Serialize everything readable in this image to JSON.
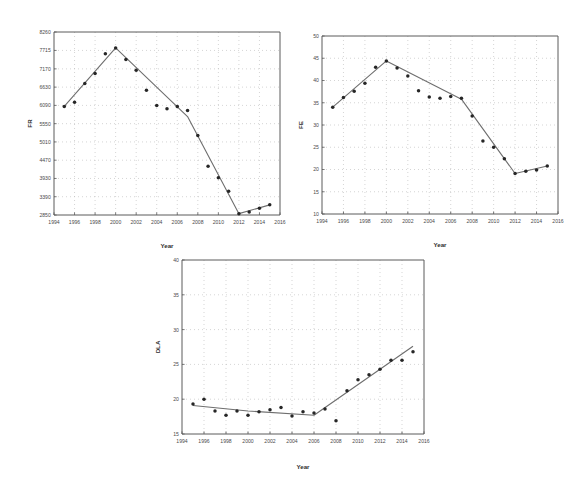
{
  "page": {
    "background": "#ffffff",
    "point_color": "#262626",
    "line_color": "#6e6e6e",
    "grid_color": "#b9b9b9",
    "axis_color": "#5a5a5a"
  },
  "chart_data": [
    {
      "id": "chart-1",
      "type": "scatter",
      "title": "",
      "xlabel": "Year",
      "ylabel": "FR",
      "xlim": [
        1994,
        2016
      ],
      "ylim": [
        2850,
        8260
      ],
      "xticks": [
        1994,
        1996,
        1998,
        2000,
        2002,
        2004,
        2006,
        2008,
        2010,
        2012,
        2014,
        2016
      ],
      "yticks": [
        2850,
        3390,
        3930,
        4470,
        5010,
        5550,
        6090,
        6630,
        7170,
        7715,
        8260
      ],
      "grid": true,
      "legend": "none",
      "x": [
        1995,
        1996,
        1997,
        1998,
        1999,
        2000,
        2001,
        2002,
        2003,
        2004,
        2005,
        2006,
        2007,
        2008,
        2009,
        2010,
        2011,
        2012,
        2013,
        2014,
        2015
      ],
      "values": [
        6060,
        6180,
        6740,
        7030,
        7620,
        7790,
        7450,
        7130,
        6540,
        6090,
        5990,
        6060,
        5940,
        5200,
        4290,
        3950,
        3550,
        2890,
        2940,
        3050,
        3150
      ],
      "series": [
        {
          "name": "FR observations",
          "values": [
            6060,
            6180,
            6740,
            7030,
            7620,
            7790,
            7450,
            7130,
            6540,
            6090,
            5990,
            6060,
            5940,
            5200,
            4290,
            3950,
            3550,
            2890,
            2940,
            3050,
            3150
          ]
        },
        {
          "name": "fitted trend",
          "x": [
            1995,
            2000,
            2007,
            2012,
            2015
          ],
          "values": [
            6060,
            7790,
            5760,
            2890,
            3150
          ]
        }
      ]
    },
    {
      "id": "chart-2",
      "type": "scatter",
      "title": "",
      "xlabel": "Year",
      "ylabel": "FE",
      "xlim": [
        1994,
        2016
      ],
      "ylim": [
        10,
        50
      ],
      "xticks": [
        1994,
        1996,
        1998,
        2000,
        2002,
        2004,
        2006,
        2008,
        2010,
        2012,
        2014,
        2016
      ],
      "yticks": [
        10,
        15,
        20,
        25,
        30,
        35,
        40,
        45,
        50
      ],
      "grid": true,
      "legend": "none",
      "x": [
        1995,
        1996,
        1997,
        1998,
        1999,
        2000,
        2001,
        2002,
        2003,
        2004,
        2005,
        2006,
        2007,
        2008,
        2009,
        2010,
        2011,
        2012,
        2013,
        2014,
        2015
      ],
      "values": [
        34.0,
        36.2,
        37.6,
        39.4,
        43.0,
        44.4,
        42.8,
        41.0,
        37.7,
        36.3,
        36.0,
        36.4,
        36.0,
        32.0,
        26.4,
        25.0,
        22.4,
        19.1,
        19.6,
        19.9,
        20.8
      ],
      "series": [
        {
          "name": "FE observations",
          "values": [
            34.0,
            36.2,
            37.6,
            39.4,
            43.0,
            44.4,
            42.8,
            41.0,
            37.7,
            36.3,
            36.0,
            36.4,
            36.0,
            32.0,
            26.4,
            25.0,
            22.4,
            19.1,
            19.6,
            19.9,
            20.8
          ]
        },
        {
          "name": "fitted trend",
          "x": [
            1995,
            2000,
            2007,
            2012,
            2015
          ],
          "values": [
            34.0,
            44.4,
            35.8,
            19.1,
            20.8
          ]
        }
      ]
    },
    {
      "id": "chart-3",
      "type": "scatter",
      "title": "",
      "xlabel": "Year",
      "ylabel": "DLA",
      "xlim": [
        1994,
        2016
      ],
      "ylim": [
        15,
        40
      ],
      "xticks": [
        1994,
        1996,
        1998,
        2000,
        2002,
        2004,
        2006,
        2008,
        2010,
        2012,
        2014,
        2016
      ],
      "yticks": [
        15,
        20,
        25,
        30,
        35,
        40
      ],
      "grid": true,
      "legend": "none",
      "x": [
        1995,
        1996,
        1997,
        1998,
        1999,
        2000,
        2001,
        2002,
        2003,
        2004,
        2005,
        2006,
        2007,
        2008,
        2009,
        2010,
        2011,
        2012,
        2013,
        2014,
        2015
      ],
      "values": [
        19.3,
        20.0,
        18.3,
        17.7,
        18.3,
        17.7,
        18.2,
        18.5,
        18.8,
        17.6,
        18.2,
        18.0,
        18.6,
        16.9,
        21.2,
        22.8,
        23.5,
        24.3,
        25.6,
        25.6,
        26.8
      ],
      "series": [
        {
          "name": "DLA observations",
          "values": [
            19.3,
            20.0,
            18.3,
            17.7,
            18.3,
            17.7,
            18.2,
            18.5,
            18.8,
            17.6,
            18.2,
            18.0,
            18.6,
            16.9,
            21.2,
            22.8,
            23.5,
            24.3,
            25.6,
            25.6,
            26.8
          ]
        },
        {
          "name": "fitted trend",
          "x": [
            1995,
            2000,
            2006,
            2015
          ],
          "values": [
            19.1,
            18.3,
            17.7,
            27.6
          ]
        }
      ]
    }
  ]
}
